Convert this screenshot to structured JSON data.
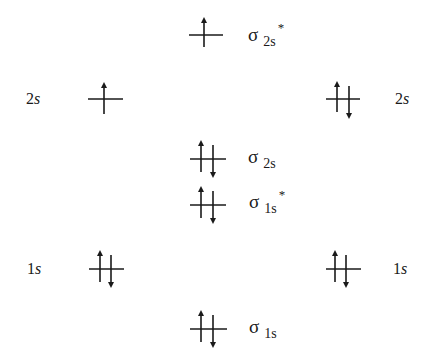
{
  "diagram": {
    "type": "molecular-orbital-energy-diagram",
    "line_color": "#1a1a1a",
    "left_atom": {
      "levels": [
        {
          "id": "left-2s",
          "label_n": "2",
          "label_l": "s",
          "electrons": [
            "up"
          ]
        },
        {
          "id": "left-1s",
          "label_n": "1",
          "label_l": "s",
          "electrons": [
            "up",
            "down"
          ]
        }
      ]
    },
    "right_atom": {
      "levels": [
        {
          "id": "right-2s",
          "label_n": "2",
          "label_l": "s",
          "electrons": [
            "up",
            "down"
          ]
        },
        {
          "id": "right-1s",
          "label_n": "1",
          "label_l": "s",
          "electrons": [
            "up",
            "down"
          ]
        }
      ]
    },
    "molecular_orbitals": [
      {
        "id": "sigma-2s-star",
        "symbol": "σ",
        "subscript": "2s",
        "antibonding": "*",
        "electrons": [
          "up"
        ]
      },
      {
        "id": "sigma-2s",
        "symbol": "σ",
        "subscript": "2s",
        "antibonding": "",
        "electrons": [
          "up",
          "down"
        ]
      },
      {
        "id": "sigma-1s-star",
        "symbol": "σ",
        "subscript": "1s",
        "antibonding": "*",
        "electrons": [
          "up",
          "down"
        ]
      },
      {
        "id": "sigma-1s",
        "symbol": "σ",
        "subscript": "1s",
        "antibonding": "",
        "electrons": [
          "up",
          "down"
        ]
      }
    ]
  }
}
